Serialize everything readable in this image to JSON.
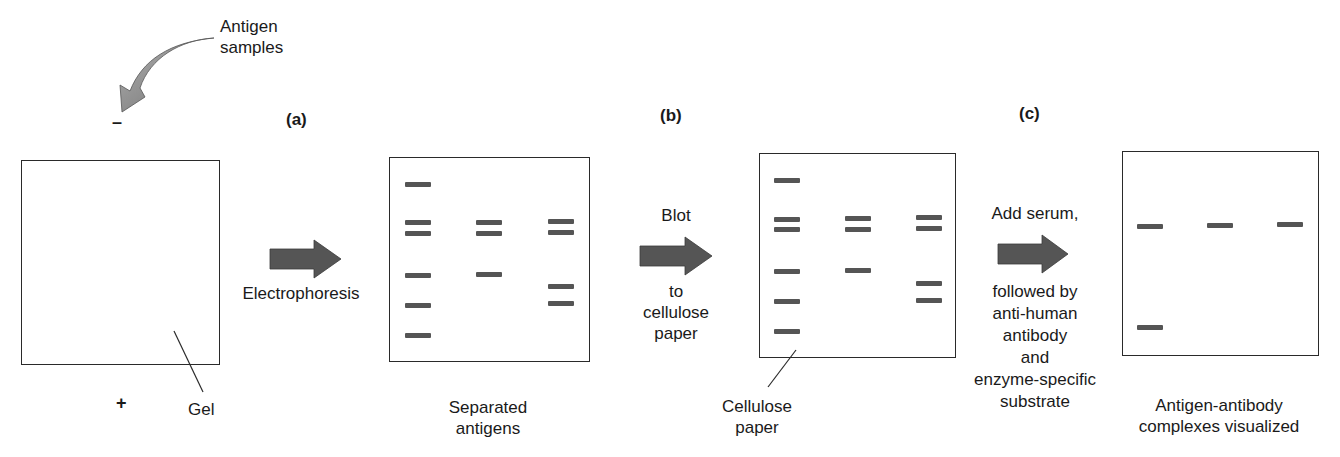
{
  "colors": {
    "band": "#555555",
    "arrow": "#555555",
    "curved_arrow": "#8a8a8a",
    "outline": "#2a2a2a"
  },
  "samples": {
    "label_line1": "Antigen",
    "label_line2": "samples",
    "icon": "curved-arrow-icon"
  },
  "gel": {
    "negative_sign": "–",
    "positive_sign": "+",
    "label": "Gel"
  },
  "steps": [
    {
      "letter": "(a)",
      "arrow_label_top": "",
      "arrow_label_bottom": [
        "Electrophoresis"
      ]
    },
    {
      "letter": "(b)",
      "arrow_label_top": "Blot",
      "arrow_label_bottom": [
        "to",
        "cellulose",
        "paper"
      ]
    },
    {
      "letter": "(c)",
      "arrow_label_top": "Add serum,",
      "arrow_label_bottom": [
        "followed by",
        "anti-human",
        "antibody",
        "and",
        "enzyme-specific",
        "substrate"
      ]
    }
  ],
  "panels": [
    {
      "name": "gel",
      "caption": [],
      "lanes": [
        [],
        [],
        []
      ]
    },
    {
      "name": "separated-antigens",
      "caption": [
        "Separated",
        "antigens"
      ],
      "lanes": [
        [
          184,
          222,
          233,
          275,
          305,
          335
        ],
        [
          222,
          233,
          274
        ],
        [
          221,
          232,
          286,
          303
        ]
      ]
    },
    {
      "name": "cellulose-paper",
      "caption": [
        "Cellulose",
        "paper"
      ],
      "lanes": [
        [
          180,
          219,
          229,
          271,
          301,
          331
        ],
        [
          218,
          229,
          270
        ],
        [
          217,
          228,
          283,
          300
        ]
      ]
    },
    {
      "name": "visualized",
      "caption": [
        "Antigen-antibody",
        "complexes visualized"
      ],
      "lanes": [
        [
          226,
          327
        ],
        [
          225
        ],
        [
          224
        ]
      ]
    }
  ]
}
